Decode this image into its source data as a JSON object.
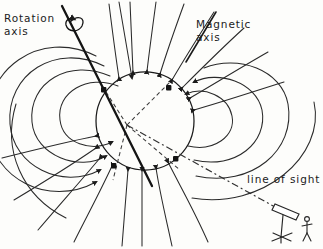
{
  "figure": {
    "name": "pulsar-magnetic-field-diagram",
    "background_color": "#fdfdfb",
    "ink_color": "#1b1b1b",
    "width": 323,
    "height": 249
  },
  "labels": {
    "rotation_axis_line1": "Rotation",
    "rotation_axis_line2": "axis",
    "magnetic_axis_line1": "Magnetic",
    "magnetic_axis_line2": "axis",
    "line_of_sight": "line of sight"
  },
  "star": {
    "center_x": 145,
    "center_y": 121,
    "radius": 49,
    "label": "neutron-star"
  },
  "axes": {
    "rotation_axis": {
      "x1": 62,
      "y1": 6,
      "x2": 150,
      "y2": 183,
      "stroke_width": 2.2,
      "rotation_arrow": "curved-spiral-arrow"
    },
    "magnetic_axis": {
      "x1": 214,
      "y1": 14,
      "x2": 104,
      "y2": 194,
      "stroke_width": 1.7
    },
    "line_of_sight": {
      "x1": 127,
      "y1": 125,
      "x2": 288,
      "y2": 215,
      "dash": "6 3 2 3",
      "stroke_width": 1.2
    }
  },
  "beam_cones": {
    "apex_x": 127,
    "apex_y": 125,
    "upper": {
      "edge1_x": 103,
      "edge1_y": 88,
      "edge2_x": 168,
      "edge2_y": 86
    },
    "lower": {
      "edge1_x": 115,
      "edge1_y": 175,
      "edge2_x": 177,
      "edge2_y": 165
    },
    "dash": "4 3",
    "dot_radius": 2.6,
    "dots": [
      {
        "x": 103,
        "y": 90
      },
      {
        "x": 168,
        "y": 88
      },
      {
        "x": 114,
        "y": 166
      },
      {
        "x": 176,
        "y": 159
      }
    ]
  },
  "telescope": {
    "label": "telescope-with-observer",
    "tube_x": 281,
    "tube_y": 214,
    "observer_x": 308,
    "observer_y": 228
  },
  "field_lines": {
    "arrowhead_style": "filled-triangle",
    "closed_loop_count": 6,
    "open_line_count": 14,
    "description": "Dipole magnetic field lines, closed loops near the equator and open lines emerging from the magnetic poles"
  }
}
